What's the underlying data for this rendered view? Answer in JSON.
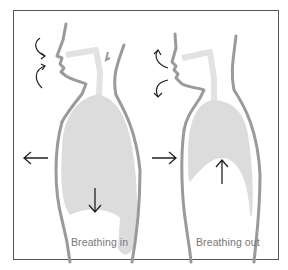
{
  "diagram": {
    "panels": [
      {
        "caption": "Breathing in",
        "chest_arrow": "outward",
        "diaphragm_arrow": "down"
      },
      {
        "caption": "Breathing out",
        "chest_arrow": "inward",
        "diaphragm_arrow": "up"
      }
    ],
    "colors": {
      "outline": "#9a9a9a",
      "lung_fill": "#dcdcdc",
      "airway": "#e2e2e2",
      "arrow": "#222222",
      "border": "#555555"
    }
  }
}
